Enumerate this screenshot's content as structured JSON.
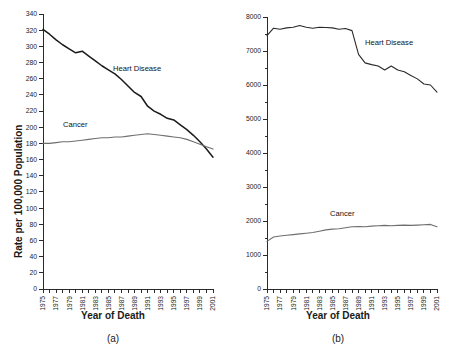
{
  "figure": {
    "panels": [
      {
        "caption": "(a)",
        "xlabel": "Year of Death",
        "ylabel": "Rate per 100,000 Population"
      },
      {
        "caption": "(b)",
        "xlabel": "Year of Death",
        "ylabel": ""
      }
    ]
  },
  "chart_data": [
    {
      "type": "line",
      "panel": "(a)",
      "title": "",
      "xlabel": "Year of Death",
      "ylabel": "Rate per 100,000 Population",
      "xlim": [
        1975,
        2001
      ],
      "ylim": [
        0,
        340
      ],
      "ytick_step": 20,
      "yticks": [
        0,
        20,
        40,
        60,
        80,
        100,
        120,
        140,
        160,
        180,
        200,
        220,
        240,
        260,
        280,
        300,
        320,
        340
      ],
      "xticks": [
        1975,
        1976,
        1977,
        1978,
        1979,
        1980,
        1981,
        1982,
        1983,
        1984,
        1985,
        1986,
        1987,
        1988,
        1989,
        1990,
        1991,
        1992,
        1993,
        1994,
        1995,
        1996,
        1997,
        1998,
        1999,
        2000,
        2001
      ],
      "xtick_labels": [
        "1975",
        "",
        "1977",
        "",
        "1979",
        "",
        "1981",
        "",
        "1983",
        "",
        "1985",
        "",
        "1987",
        "",
        "1989",
        "",
        "1991",
        "",
        "1993",
        "",
        "1995",
        "",
        "1997",
        "",
        "1999",
        "",
        "2001"
      ],
      "grid": false,
      "legend_position": "inline-annotation",
      "x": [
        1975,
        1976,
        1977,
        1978,
        1979,
        1980,
        1981,
        1982,
        1983,
        1984,
        1985,
        1986,
        1987,
        1988,
        1989,
        1990,
        1991,
        1992,
        1993,
        1994,
        1995,
        1996,
        1997,
        1998,
        1999,
        2000,
        2001
      ],
      "series": [
        {
          "name": "Heart Disease",
          "color": "#1b1b1b",
          "values": [
            321,
            315,
            308,
            302,
            297,
            292,
            294,
            288,
            282,
            276,
            271,
            266,
            259,
            251,
            243,
            238,
            226,
            220,
            216,
            211,
            209,
            203,
            197,
            190,
            182,
            173,
            163
          ]
        },
        {
          "name": "Cancer",
          "color": "#6e6e6e",
          "values": [
            180,
            180,
            181,
            182,
            182,
            183,
            184,
            185,
            186,
            187,
            187,
            188,
            188,
            189,
            190,
            191,
            192,
            191,
            190,
            189,
            188,
            187,
            185,
            182,
            179,
            176,
            173
          ]
        }
      ]
    },
    {
      "type": "line",
      "panel": "(b)",
      "title": "",
      "xlabel": "Year of Death",
      "ylabel": "",
      "xlim": [
        1975,
        2001
      ],
      "ylim": [
        0,
        8000
      ],
      "ytick_step": 1000,
      "yticks": [
        0,
        1000,
        2000,
        3000,
        4000,
        5000,
        6000,
        7000,
        8000
      ],
      "minor_ytick_step": 500,
      "xticks": [
        1975,
        1976,
        1977,
        1978,
        1979,
        1980,
        1981,
        1982,
        1983,
        1984,
        1985,
        1986,
        1987,
        1988,
        1989,
        1990,
        1991,
        1992,
        1993,
        1994,
        1995,
        1996,
        1997,
        1998,
        1999,
        2000,
        2001
      ],
      "xtick_labels": [
        "1975",
        "",
        "1977",
        "",
        "1979",
        "",
        "1981",
        "",
        "1983",
        "",
        "1985",
        "",
        "1987",
        "",
        "1989",
        "",
        "1991",
        "",
        "1993",
        "",
        "1995",
        "",
        "1997",
        "",
        "1999",
        "",
        "2001"
      ],
      "grid": false,
      "legend_position": "inline-annotation",
      "x": [
        1975,
        1976,
        1977,
        1978,
        1979,
        1980,
        1981,
        1982,
        1983,
        1984,
        1985,
        1986,
        1987,
        1988,
        1989,
        1990,
        1991,
        1992,
        1993,
        1994,
        1995,
        1996,
        1997,
        1998,
        1999,
        2000,
        2001
      ],
      "series": [
        {
          "name": "Heart Disease",
          "color": "#2a2a2a",
          "values": [
            7450,
            7670,
            7640,
            7680,
            7700,
            7750,
            7700,
            7670,
            7700,
            7690,
            7680,
            7640,
            7660,
            7600,
            6900,
            6650,
            6600,
            6560,
            6440,
            6560,
            6440,
            6390,
            6280,
            6180,
            6030,
            6000,
            5790
          ]
        },
        {
          "name": "Cancer",
          "color": "#6e6e6e",
          "values": [
            1400,
            1530,
            1560,
            1580,
            1600,
            1620,
            1640,
            1660,
            1700,
            1740,
            1760,
            1770,
            1800,
            1830,
            1840,
            1830,
            1850,
            1860,
            1870,
            1860,
            1870,
            1880,
            1870,
            1880,
            1890,
            1900,
            1830
          ]
        }
      ]
    }
  ],
  "annotations": {
    "panel_a": {
      "heart_label": "Heart Disease",
      "cancer_label": "Cancer"
    },
    "panel_b": {
      "heart_label": "Heart Disease",
      "cancer_label": "Cancer"
    }
  }
}
